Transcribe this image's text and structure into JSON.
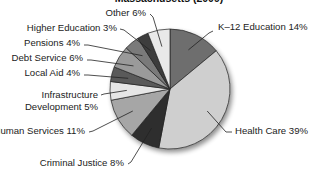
{
  "chart_data": {
    "type": "pie",
    "title": "Massachusetts (2009)",
    "start": "12 o'clock",
    "direction": "clockwise",
    "slices": [
      {
        "name": "K-12 Education",
        "label": "K–12 Education 14%",
        "value": 14,
        "color": "#6e6e6e"
      },
      {
        "name": "Health Care",
        "label": "Health Care 39%",
        "value": 39,
        "color": "#cfcfcf"
      },
      {
        "name": "Criminal Justice",
        "label": "Criminal Justice 8%",
        "value": 8,
        "color": "#2e2e2e"
      },
      {
        "name": "Human Services",
        "label": "Human Services 11%",
        "value": 11,
        "color": "#a6a6a6"
      },
      {
        "name": "Infrastructure Development",
        "label_lines": [
          "Infrastructure",
          "Development 5%"
        ],
        "label": "Infrastructure Development 5%",
        "value": 5,
        "color": "#e6e6e6"
      },
      {
        "name": "Local Aid",
        "label": "Local Aid 4%",
        "value": 4,
        "color": "#5a5a5a"
      },
      {
        "name": "Debt Service",
        "label": "Debt Service 6%",
        "value": 6,
        "color": "#9a9a9a"
      },
      {
        "name": "Pensions",
        "label": "Pensions 4%",
        "value": 4,
        "color": "#7a7a7a"
      },
      {
        "name": "Higher Education",
        "label": "Higher Education 3%",
        "value": 3,
        "color": "#3c3c3c"
      },
      {
        "name": "Other",
        "label": "Other 6%",
        "value": 6,
        "color": "#e9e9e9"
      }
    ]
  }
}
